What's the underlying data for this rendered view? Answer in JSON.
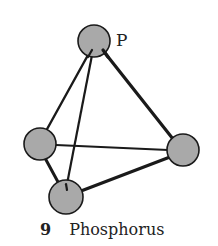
{
  "figure": {
    "atom_label": "P",
    "caption_number": "9",
    "caption_text": "Phosphorus",
    "atom_fill": "#a9a9a9",
    "stroke": "#1a1a1a"
  },
  "molecule": {
    "name": "Phosphorus (P4)",
    "geometry": "tetrahedral",
    "atoms": [
      {
        "id": "top",
        "label": "P",
        "cx": 94,
        "cy": 41,
        "r": 16
      },
      {
        "id": "left",
        "cx": 40,
        "cy": 144,
        "r": 16
      },
      {
        "id": "right",
        "cx": 183,
        "cy": 150,
        "r": 16
      },
      {
        "id": "bottom",
        "cx": 66,
        "cy": 197,
        "r": 17
      }
    ],
    "bonds": [
      [
        "top",
        "left"
      ],
      [
        "top",
        "right"
      ],
      [
        "top",
        "bottom"
      ],
      [
        "left",
        "right"
      ],
      [
        "left",
        "bottom"
      ],
      [
        "right",
        "bottom"
      ]
    ]
  }
}
